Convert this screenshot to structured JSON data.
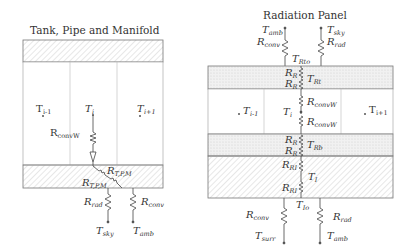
{
  "left_diagram": {
    "title": "Tank, Pipe and Manifold",
    "nodes": {
      "t_prev": "T",
      "t_prev_sub": "i-1",
      "t_cur": "T",
      "t_cur_sub": "i",
      "t_next": "T",
      "t_next_sub": "i+1",
      "t_sky": "T",
      "t_sky_sub": "sky",
      "t_amb": "T",
      "t_amb_sub": "amb"
    },
    "resistors": {
      "r_convw": "R",
      "r_convw_sub": "convW",
      "r_tpm_upper": "R",
      "r_tpm_upper_sub": "T,P,M",
      "r_tpm_lower": "R",
      "r_tpm_lower_sub": "T,P,M",
      "r_rad": "R",
      "r_rad_sub": "rad",
      "r_conv": "R",
      "r_conv_sub": "conv"
    }
  },
  "right_diagram": {
    "title": "Radiation Panel",
    "nodes": {
      "t_amb_top": "T",
      "t_amb_top_sub": "amb",
      "t_sky_top": "T",
      "t_sky_top_sub": "sky",
      "t_rto": "T",
      "t_rto_sub": "Rto",
      "t_rt": "T",
      "t_rt_sub": "Rt",
      "t_prev": "T",
      "t_prev_sub": "i-1",
      "t_cur": "T",
      "t_cur_sub": "i",
      "t_next": "T",
      "t_next_sub": "i+1",
      "t_rb": "T",
      "t_rb_sub": "Rb",
      "t_i": "T",
      "t_i_sub": "I",
      "t_io": "T",
      "t_io_sub": "Io",
      "t_surr": "T",
      "t_surr_sub": "surr",
      "t_amb_bot": "T",
      "t_amb_bot_sub": "amb"
    },
    "resistors": {
      "r_conv_top": "R",
      "r_conv_top_sub": "conv",
      "r_rad_top": "R",
      "r_rad_top_sub": "rad",
      "r_r1": "R",
      "r_r1_sub": "R",
      "r_r2": "R",
      "r_r2_sub": "R",
      "r_convw1": "R",
      "r_convw1_sub": "convW",
      "r_convw2": "R",
      "r_convw2_sub": "convW",
      "r_r3": "R",
      "r_r3_sub": "R",
      "r_r4": "R",
      "r_r4_sub": "R",
      "r_ri1": "R",
      "r_ri1_sub": "RI",
      "r_ri2": "R",
      "r_ri2_sub": "RI",
      "r_conv_bot": "R",
      "r_conv_bot_sub": "conv",
      "r_rad_bot": "R",
      "r_rad_bot_sub": "rad"
    }
  }
}
